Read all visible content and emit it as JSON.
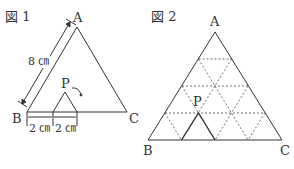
{
  "figure1": {
    "title": "図 1",
    "vertex_a": "A",
    "vertex_b": "B",
    "vertex_c": "C",
    "point_p": "P",
    "side_length": "8 ㎝",
    "dim1": "2 ㎝",
    "dim2": "2 ㎝"
  },
  "figure2": {
    "title": "図 2",
    "vertex_a": "A",
    "vertex_b": "B",
    "vertex_c": "C",
    "point_p": "P"
  }
}
